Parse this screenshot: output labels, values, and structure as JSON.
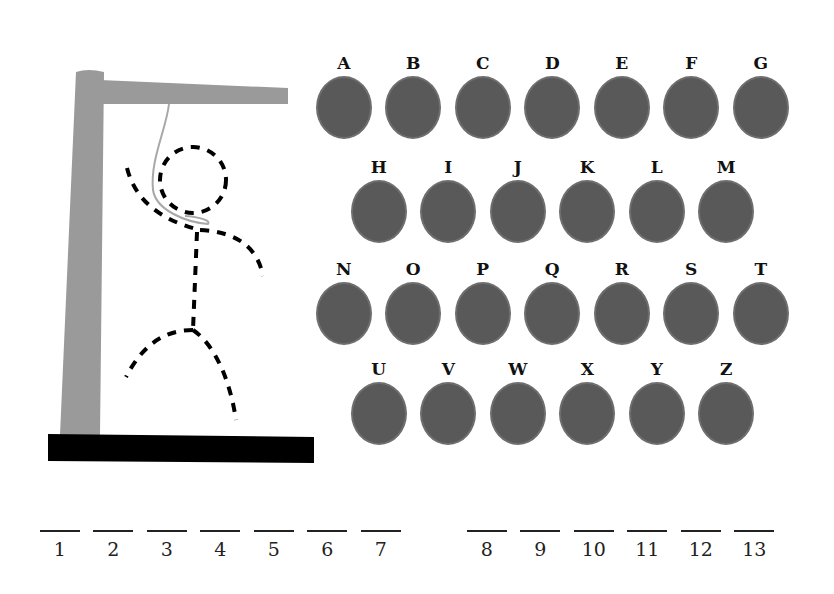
{
  "game": {
    "title": "Hangman",
    "keyboard": {
      "rows": [
        [
          "A",
          "B",
          "C",
          "D",
          "E",
          "F",
          "G"
        ],
        [
          "H",
          "I",
          "J",
          "K",
          "L",
          "M"
        ],
        [
          "N",
          "O",
          "P",
          "Q",
          "R",
          "S",
          "T"
        ],
        [
          "U",
          "V",
          "W",
          "X",
          "Y",
          "Z"
        ]
      ]
    },
    "word_slots": {
      "group1": [
        "1",
        "2",
        "3",
        "4",
        "5",
        "6",
        "7"
      ],
      "group2": [
        "8",
        "9",
        "10",
        "11",
        "12",
        "13"
      ]
    },
    "colors": {
      "button_fill": "#595959",
      "gallows": "#999999",
      "base": "#000000"
    }
  }
}
